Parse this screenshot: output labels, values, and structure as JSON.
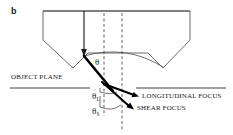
{
  "figure": {
    "panel_letter": "b",
    "type": "ray-diagram",
    "background_color": "#ffffff",
    "ink_color": "#1a1a1a",
    "ray_color": "#000000",
    "thin_line_color": "#555555"
  },
  "labels": {
    "object_plane": "OBJECT PLANE",
    "longitudinal_focus": "LONGITUDINAL FOCUS",
    "shear_focus": "SHEAR FOCUS",
    "theta_incident": "θ",
    "theta_longitudinal_symbol": "θ",
    "theta_longitudinal_sub": "L",
    "theta_shear_symbol": "θ",
    "theta_shear_sub": "S"
  },
  "geometry": {
    "wedge_outline": "M 43,11 L 190,11 L 190,40 L 163,68 L 148,53 L 88,53 L 73,68 L 43,40 Z",
    "incident_beam": {
      "x1": 84,
      "y1": 11,
      "x2": 84,
      "y2": 55
    },
    "refraction_point": {
      "x": 84,
      "y": 56
    },
    "focus_point": {
      "x": 110,
      "y": 88
    },
    "longitudinal_arrow_tip": {
      "x": 138,
      "y": 96
    },
    "shear_arrow_tip": {
      "x": 133,
      "y": 108
    },
    "dashed_line_left_x": 104,
    "dashed_line_right_x": 122,
    "object_plane_left": {
      "x1": 10,
      "y1": 88,
      "x2": 90,
      "y2": 88
    },
    "object_plane_right": {
      "x1": 136,
      "y1": 88,
      "x2": 226,
      "y2": 88
    },
    "arc_span_start": {
      "x": 84,
      "y": 56
    },
    "arc_span_end": {
      "x": 163,
      "y": 68
    }
  },
  "label_positions": {
    "panel_letter": {
      "left": 11,
      "top": 7
    },
    "object_plane": {
      "left": 11,
      "top": 74
    },
    "longitudinal_focus": {
      "left": 142,
      "top": 93
    },
    "shear_focus": {
      "left": 137,
      "top": 105
    },
    "theta_incident": {
      "left": 95,
      "top": 58
    },
    "theta_longitudinal": {
      "left": 92,
      "top": 93
    },
    "theta_shear": {
      "left": 92,
      "top": 108
    }
  }
}
